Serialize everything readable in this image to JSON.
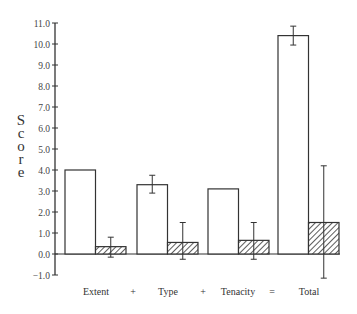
{
  "chart_data": {
    "type": "bar",
    "title": "",
    "xlabel": "",
    "ylabel": "Score",
    "ylim": [
      -1.0,
      11.0
    ],
    "yticks": [
      "11.0",
      "10.0",
      "9.0",
      "8.0",
      "7.0",
      "6.0",
      "5.0",
      "4.0",
      "3.0",
      "2.0",
      "1.0",
      "0.0",
      "-1.0"
    ],
    "grid": false,
    "legend": null,
    "categories": [
      "Extent",
      "Type",
      "Tenacity",
      "Total"
    ],
    "separators": [
      "+",
      "+",
      "="
    ],
    "series": [
      {
        "name": "open",
        "fill": "none",
        "values": [
          4.0,
          3.3,
          3.1,
          10.4
        ],
        "error_low": [
          null,
          2.9,
          null,
          9.95
        ],
        "error_high": [
          null,
          3.75,
          null,
          10.85
        ]
      },
      {
        "name": "hatched",
        "fill": "hatch",
        "values": [
          0.35,
          0.55,
          0.65,
          1.5
        ],
        "error_low": [
          -0.15,
          -0.25,
          -0.25,
          -1.15
        ],
        "error_high": [
          0.8,
          1.5,
          1.5,
          4.2
        ]
      }
    ]
  },
  "colors": {
    "axis": "#333333",
    "bar_edge": "#333333",
    "background": "#ffffff"
  }
}
